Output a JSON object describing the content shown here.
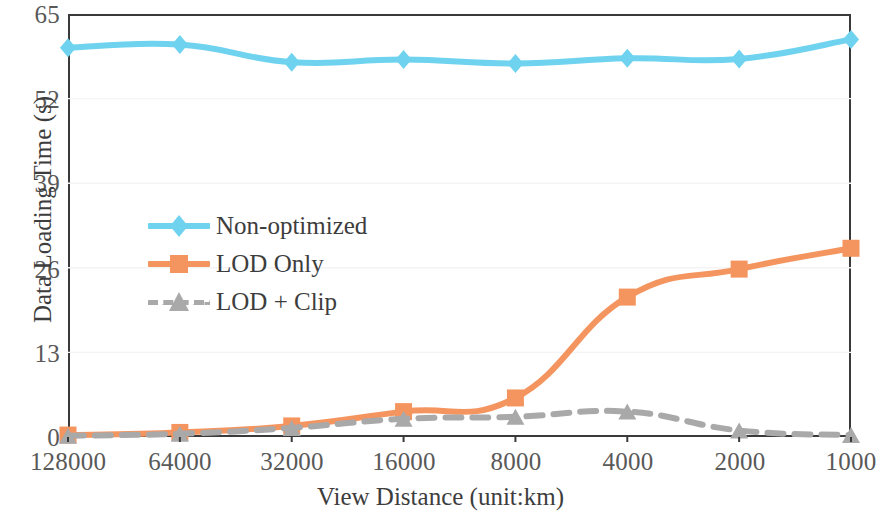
{
  "chart_data": {
    "type": "line",
    "title": "",
    "xlabel": "View Distance (unit:km)",
    "ylabel": "Data Loading Time (s)",
    "categories": [
      "128000",
      "64000",
      "32000",
      "16000",
      "8000",
      "4000",
      "2000",
      "1000"
    ],
    "x_tick_labels": [
      "128000",
      "64000",
      "32000",
      "16000",
      "8000",
      "4000",
      "2000",
      "1000"
    ],
    "y_tick_labels": [
      "0",
      "13",
      "26",
      "39",
      "52",
      "65"
    ],
    "y_ticks": [
      0,
      13,
      26,
      39,
      52,
      65
    ],
    "ylim": [
      0,
      65
    ],
    "grid": true,
    "legend_position": "center-left-inside",
    "series": [
      {
        "name": "Non-optimized",
        "color": "#6FD3EF",
        "marker": "diamond",
        "linestyle": "solid",
        "values": [
          59.8,
          60.3,
          57.6,
          58.0,
          57.4,
          58.2,
          58.1,
          61.1
        ]
      },
      {
        "name": "LOD Only",
        "color": "#F4955F",
        "marker": "square",
        "linestyle": "solid",
        "values": [
          0.3,
          0.7,
          1.7,
          3.9,
          6.0,
          21.5,
          25.8,
          29.0
        ]
      },
      {
        "name": "LOD + Clip",
        "color": "#A9A9A9",
        "marker": "triangle",
        "linestyle": "dashed",
        "values": [
          0.2,
          0.5,
          1.4,
          2.8,
          3.1,
          3.9,
          1.0,
          0.3
        ]
      }
    ]
  },
  "legend": {
    "items": [
      {
        "label": "Non-optimized",
        "color": "#6FD3EF",
        "marker": "diamond",
        "dashed": false
      },
      {
        "label": "LOD Only",
        "color": "#F4955F",
        "marker": "square",
        "dashed": false
      },
      {
        "label": "LOD + Clip",
        "color": "#A9A9A9",
        "marker": "triangle",
        "dashed": true
      }
    ]
  },
  "axes": {
    "x_title": "View Distance (unit:km)",
    "y_title": "Data Loading Time (s)",
    "frame_color": "#3a3a3a",
    "grid_color": "#f4f4f4",
    "tick_text_color": "#595959"
  }
}
